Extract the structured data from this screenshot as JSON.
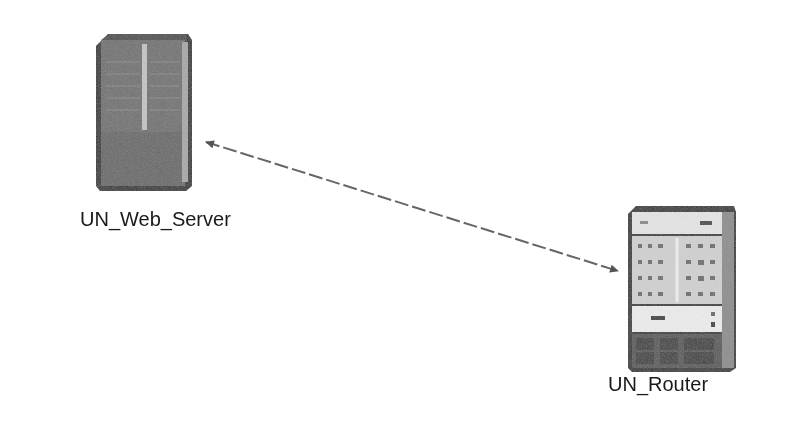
{
  "diagram": {
    "nodes": [
      {
        "id": "web_server",
        "label": "UN_Web_Server",
        "type": "server-icon"
      },
      {
        "id": "router",
        "label": "UN_Router",
        "type": "router-icon"
      }
    ],
    "links": [
      {
        "from": "web_server",
        "to": "router",
        "style": "dashed",
        "arrows": "both"
      }
    ]
  },
  "colors": {
    "background": "#ffffff",
    "device_dark": "#3a3a3a",
    "device_mid": "#7a7a7a",
    "device_light": "#d8d8d8",
    "link": "#555555",
    "text": "#1a1a1a"
  }
}
